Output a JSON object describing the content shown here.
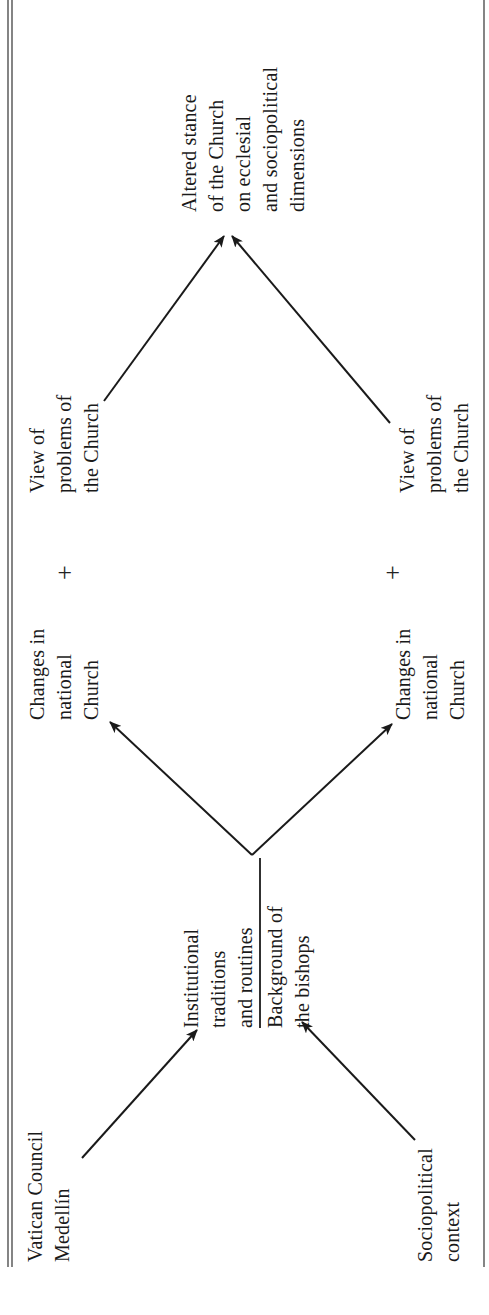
{
  "diagram": {
    "orientation": "rotated 90 degrees counter-clockwise",
    "colors": {
      "ink": "#1a1a1a",
      "background": "#ffffff"
    },
    "nodes": {
      "vatican_council": {
        "lines": [
          "Vatican Council",
          "Medellín"
        ]
      },
      "sociopolitical_context": {
        "lines": [
          "Sociopolitical",
          "context"
        ]
      },
      "institutional_traditions": {
        "lines": [
          "Institutional",
          "traditions",
          "and routines"
        ]
      },
      "background_bishops": {
        "lines": [
          "Background of",
          "the bishops"
        ]
      },
      "changes_national_church_top": {
        "lines": [
          "Changes in",
          "national",
          "Church"
        ]
      },
      "changes_national_church_bottom": {
        "lines": [
          "Changes in",
          "national",
          "Church"
        ]
      },
      "view_problems_top": {
        "lines": [
          "View of",
          "problems of",
          "the Church"
        ]
      },
      "view_problems_bottom": {
        "lines": [
          "View of",
          "problems of",
          "the Church"
        ]
      },
      "altered_stance": {
        "lines": [
          "Altered stance",
          "of the Church",
          "on ecclesial",
          "and sociopolitical",
          "dimensions"
        ]
      }
    },
    "operators": {
      "plus_top": "+",
      "plus_bottom": "+"
    },
    "edges": [
      {
        "from": "Vatican Council / Medellín",
        "to": "Institutional traditions and routines"
      },
      {
        "from": "Sociopolitical context",
        "to": "Background of the bishops"
      },
      {
        "from": "Institutional traditions / Background of the bishops",
        "to": "Changes in national Church (top)"
      },
      {
        "from": "Institutional traditions / Background of the bishops",
        "to": "Changes in national Church (bottom)"
      },
      {
        "from": "View of problems of the Church (top)",
        "to": "Altered stance of the Church"
      },
      {
        "from": "View of problems of the Church (bottom)",
        "to": "Altered stance of the Church"
      }
    ]
  }
}
